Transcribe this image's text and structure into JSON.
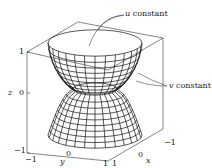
{
  "figure": {
    "type": "3d-parametric-surface",
    "colors": {
      "line": "#111111",
      "box": "#333333",
      "background": "#ffffff"
    }
  },
  "annotations": {
    "u_label_var": "u",
    "u_label_text": " constant",
    "v_label_var": "v",
    "v_label_text": " constant"
  },
  "axes": {
    "z": {
      "label": "z",
      "ticks": [
        "1",
        "0",
        "−1"
      ]
    },
    "y": {
      "label": "y",
      "ticks": [
        "−1",
        "0",
        "1"
      ]
    },
    "x": {
      "label": "x",
      "ticks": [
        "1",
        "0",
        "−1"
      ]
    }
  }
}
